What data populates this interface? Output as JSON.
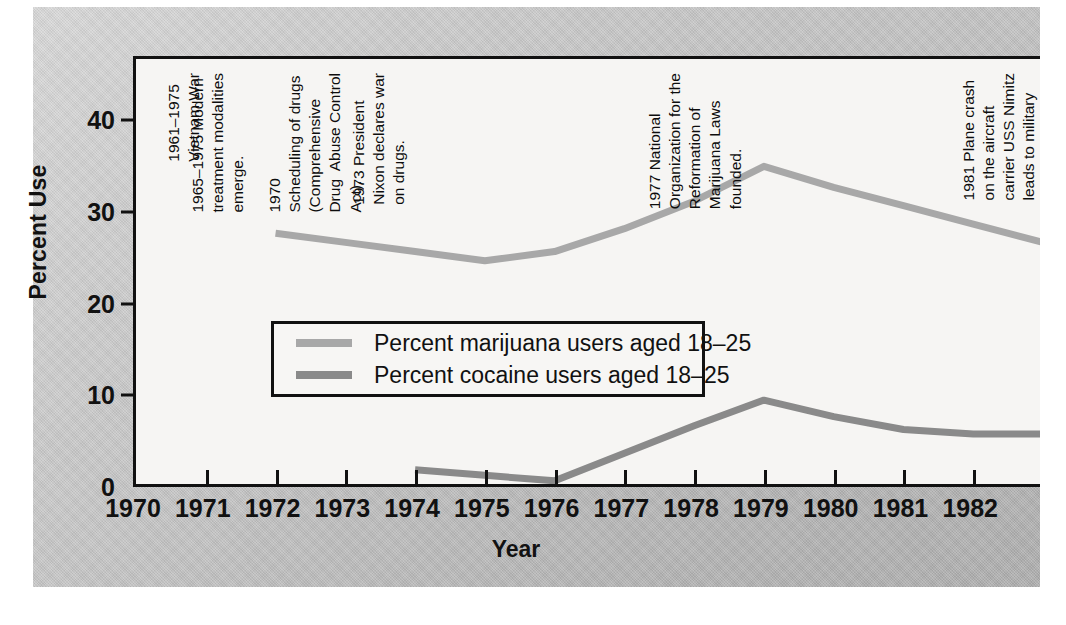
{
  "chart_data": {
    "type": "line",
    "title": "",
    "xlabel": "Year",
    "ylabel": "Percent Use",
    "xlim": [
      1970,
      1983
    ],
    "ylim": [
      0,
      47
    ],
    "grid": false,
    "legend_position": "inside-center-left",
    "xticks": [
      "1970",
      "1971",
      "1972",
      "1973",
      "1974",
      "1975",
      "1976",
      "1977",
      "1978",
      "1979",
      "1980",
      "1981",
      "1982"
    ],
    "yticks": [
      "0",
      "10",
      "20",
      "30",
      "40"
    ],
    "series": [
      {
        "name": "Percent marijuana users aged 18–25",
        "color": "#a8a8a8",
        "x": [
          1972,
          1973,
          1974,
          1975,
          1976,
          1977,
          1978,
          1979,
          1980,
          1981,
          1982,
          1983
        ],
        "values": [
          28.0,
          27.0,
          26.0,
          25.0,
          26.0,
          28.5,
          31.5,
          35.3,
          33.0,
          31.0,
          29.0,
          27.0
        ]
      },
      {
        "name": "Percent cocaine users aged 18–25",
        "color": "#8a8a8a",
        "x": [
          1974,
          1975,
          1976,
          1977,
          1978,
          1979,
          1980,
          1981,
          1982,
          1983
        ],
        "values": [
          2.2,
          1.6,
          1.0,
          4.0,
          7.0,
          9.8,
          8.0,
          6.6,
          6.1,
          6.1
        ]
      }
    ],
    "annotations": [
      {
        "id": "annotation-vietnam-war",
        "year": 1970.4,
        "text": "1961–1975\nVietnam War"
      },
      {
        "id": "annotation-treatment-modalities",
        "year": 1970.75,
        "text": "1965–1975 Modern\ntreatment modalities\nemerge."
      },
      {
        "id": "annotation-scheduling-of-drugs",
        "year": 1971.85,
        "text": "1970\nScheduling of drugs\n(Comprehensive\nDrug  Abuse Control\nAct)."
      },
      {
        "id": "annotation-nixon-war-on-drugs",
        "year": 1973.05,
        "text": "1973 President\nNixon declares war\non drugs."
      },
      {
        "id": "annotation-norml-founded",
        "year": 1977.3,
        "text": "1977 National\nOrganization for the\nReformation of\nMarijuana Laws\nfounded."
      },
      {
        "id": "annotation-uss-nimitz",
        "year": 1981.8,
        "text": "1981 Plane crash\non the aircraft\ncarrier USS Nimitz\nleads to military\ndrug testing."
      }
    ]
  },
  "legend": {
    "items": [
      {
        "label": "Percent marijuana users aged 18–25",
        "color": "#a8a8a8"
      },
      {
        "label": "Percent cocaine users aged 18–25",
        "color": "#8a8a8a"
      }
    ]
  },
  "axes": {
    "y_title": "Percent Use",
    "x_title": "Year"
  }
}
